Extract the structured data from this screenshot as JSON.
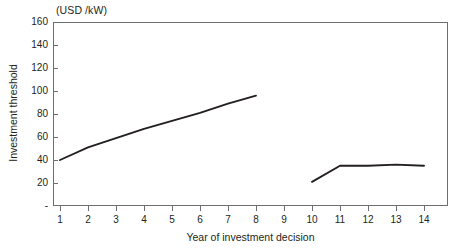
{
  "chart_data": {
    "type": "line",
    "title": "",
    "unit_caption": "(USD /kW)",
    "xlabel": "Year of investment decision",
    "ylabel": "Investment threshold",
    "xlim": [
      0.5,
      14.5
    ],
    "ylim": [
      0,
      160
    ],
    "grid": false,
    "legend": "none",
    "x_ticks": [
      1,
      2,
      3,
      4,
      5,
      6,
      7,
      8,
      9,
      10,
      11,
      12,
      13,
      14
    ],
    "x_tick_labels": [
      "1",
      "2",
      "3",
      "4",
      "5",
      "6",
      "7",
      "8",
      "9",
      "10",
      "11",
      "12",
      "13",
      "14"
    ],
    "y_ticks": [
      0,
      20,
      40,
      60,
      80,
      100,
      120,
      140,
      160
    ],
    "y_tick_labels": [
      "-",
      "20",
      "40",
      "60",
      "80",
      "100",
      "120",
      "140",
      "160"
    ],
    "line_color": "#231f20",
    "axis_color": "#6d6e71",
    "series": [
      {
        "name": "segment-1",
        "x": [
          1,
          2,
          3,
          4,
          5,
          6,
          7,
          8
        ],
        "values": [
          40,
          51,
          59,
          67,
          74,
          81,
          89,
          96
        ]
      },
      {
        "name": "segment-2",
        "x": [
          10,
          11,
          12,
          13,
          14
        ],
        "values": [
          21,
          35,
          35,
          36,
          35
        ]
      }
    ]
  }
}
